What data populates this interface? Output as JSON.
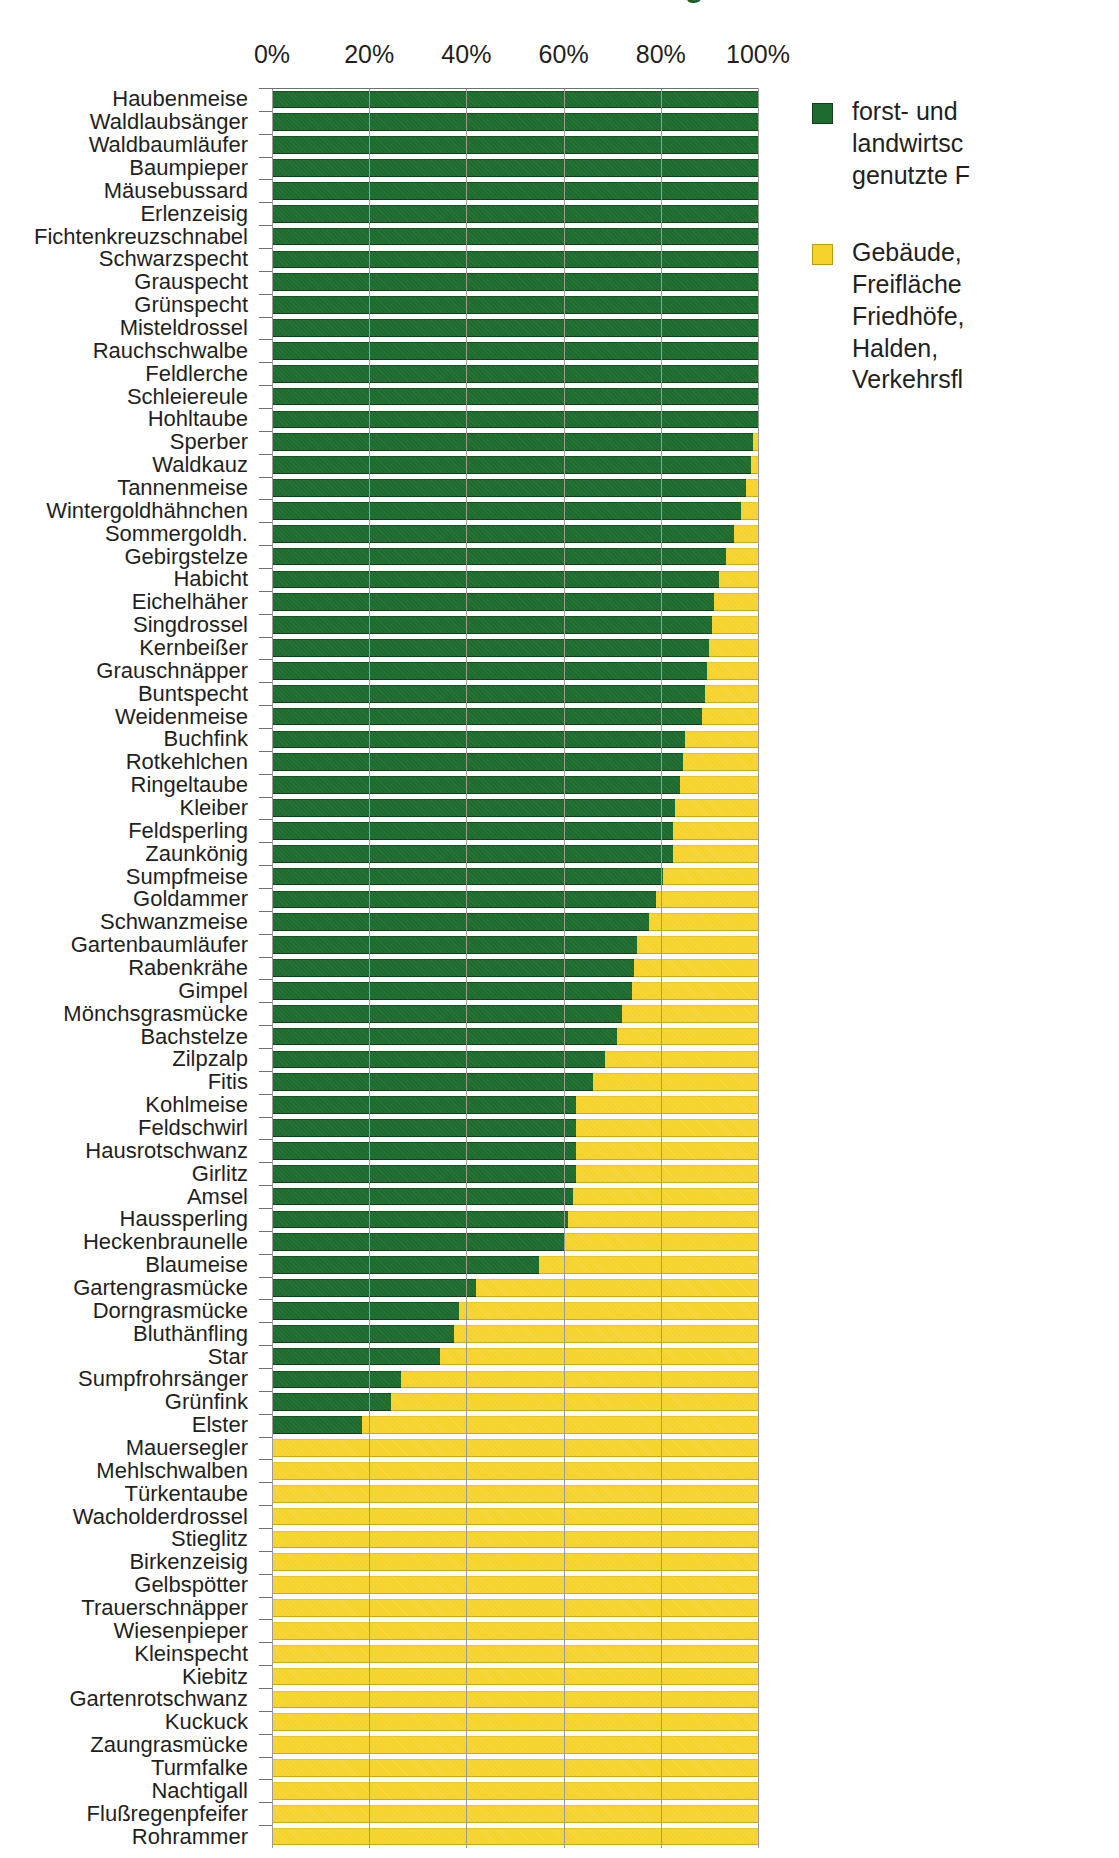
{
  "title": "Bestandsanteile in forst- und landwirtschaftlich genutzten Flächen",
  "legend": {
    "entries": [
      {
        "name": "series-forst-landwirtschaft",
        "color": "#1d6b2e",
        "swatch": "green",
        "lines": [
          "forst- und",
          "landwirtsc",
          "genutzte F"
        ],
        "full_label": "forst- und landwirtschaftlich genutzte Flächen"
      },
      {
        "name": "series-gebaeude-freiflaechen",
        "color": "#f5d32a",
        "swatch": "yellow",
        "lines": [
          "Gebäude,",
          "Freifläche",
          "Friedhöfe,",
          "Halden,",
          "Verkehrsfl"
        ],
        "full_label": "Gebäude, Freiflächen, Friedhöfe, Halden, Verkehrsflächen"
      }
    ]
  },
  "chart_data": {
    "type": "bar",
    "orientation": "horizontal",
    "stacked": true,
    "normalized": true,
    "title": "Bestandsanteile in forst- und landwirtschaftlich genutzten Flächen",
    "xlabel": "",
    "ylabel": "",
    "xlim": [
      0,
      100
    ],
    "xticks": [
      0,
      20,
      40,
      60,
      80,
      100
    ],
    "xtick_labels": [
      "0%",
      "20%",
      "40%",
      "60%",
      "80%",
      "100%"
    ],
    "grid": true,
    "grid_axis": "x",
    "legend_position": "right",
    "series": [
      {
        "name": "forst- und landwirtschaftlich genutzte Flächen",
        "color": "#1d6b2e"
      },
      {
        "name": "Gebäude, Freiflächen, Friedhöfe, Halden, Verkehrsflächen",
        "color": "#f5d32a"
      }
    ],
    "categories": [
      "Haubenmeise",
      "Waldlaubsänger",
      "Waldbaumläufer",
      "Baumpieper",
      "Mäusebussard",
      "Erlenzeisig",
      "Fichtenkreuzschnabel",
      "Schwarzspecht",
      "Grauspecht",
      "Grünspecht",
      "Misteldrossel",
      "Rauchschwalbe",
      "Feldlerche",
      "Schleiereule",
      "Hohltaube",
      "Sperber",
      "Waldkauz",
      "Tannenmeise",
      "Wintergoldhähnchen",
      "Sommergoldh.",
      "Gebirgstelze",
      "Habicht",
      "Eichelhäher",
      "Singdrossel",
      "Kernbeißer",
      "Grauschnäpper",
      "Buntspecht",
      "Weidenmeise",
      "Buchfink",
      "Rotkehlchen",
      "Ringeltaube",
      "Kleiber",
      "Feldsperling",
      "Zaunkönig",
      "Sumpfmeise",
      "Goldammer",
      "Schwanzmeise",
      "Gartenbaumläufer",
      "Rabenkrähe",
      "Gimpel",
      "Mönchsgrasmücke",
      "Bachstelze",
      "Zilpzalp",
      "Fitis",
      "Kohlmeise",
      "Feldschwirl",
      "Hausrotschwanz",
      "Girlitz",
      "Amsel",
      "Haussperling",
      "Heckenbraunelle",
      "Blaumeise",
      "Gartengrasmücke",
      "Dorngrasmücke",
      "Bluthänfling",
      "Star",
      "Sumpfrohrsänger",
      "Grünfink",
      "Elster",
      "Mauersegler",
      "Mehlschwalben",
      "Türkentaube",
      "Wacholderdrossel",
      "Stieglitz",
      "Birkenzeisig",
      "Gelbspötter",
      "Trauerschnäpper",
      "Wiesenpieper",
      "Kleinspecht",
      "Kiebitz",
      "Gartenrotschwanz",
      "Kuckuck",
      "Zaungrasmücke",
      "Turmfalke",
      "Nachtigall",
      "Flußregenpfeifer",
      "Rohrammer"
    ],
    "values_green_percent": [
      100,
      100,
      100,
      100,
      100,
      100,
      100,
      100,
      100,
      100,
      100,
      100,
      100,
      100,
      100,
      99,
      98.5,
      97.5,
      96.5,
      95,
      93.5,
      92,
      91,
      90.5,
      90,
      89.5,
      89,
      88.5,
      85,
      84.5,
      84,
      83,
      82.5,
      82.5,
      80.5,
      79,
      77.5,
      75,
      74.5,
      74,
      72,
      71,
      68.5,
      66,
      62.5,
      62.5,
      62.5,
      62.5,
      62,
      61,
      60,
      55,
      42,
      38.5,
      37.5,
      34.5,
      26.5,
      24.5,
      18.5,
      0,
      0,
      0,
      0,
      0,
      0,
      0,
      0,
      0,
      0,
      0,
      0,
      0,
      0,
      0,
      0,
      0,
      0
    ],
    "values_yellow_percent": [
      0,
      0,
      0,
      0,
      0,
      0,
      0,
      0,
      0,
      0,
      0,
      0,
      0,
      0,
      0,
      1,
      1.5,
      2.5,
      3.5,
      5,
      6.5,
      8,
      9,
      9.5,
      10,
      10.5,
      11,
      11.5,
      15,
      15.5,
      16,
      17,
      17.5,
      17.5,
      19.5,
      21,
      22.5,
      25,
      25.5,
      26,
      28,
      29,
      31.5,
      34,
      37.5,
      37.5,
      37.5,
      37.5,
      38,
      39,
      40,
      45,
      58,
      61.5,
      62.5,
      65.5,
      73.5,
      75.5,
      81.5,
      100,
      100,
      100,
      100,
      100,
      100,
      100,
      100,
      100,
      100,
      100,
      100,
      100,
      100,
      100,
      100,
      100,
      100
    ]
  }
}
